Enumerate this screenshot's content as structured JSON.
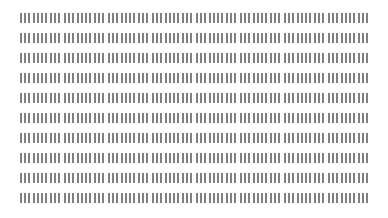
{
  "grid": {
    "rows": 10,
    "columns": 8,
    "bars_per_cell": 10,
    "bar_color": "#7f7f7f",
    "background_color": "#ffffff",
    "cell_content": "illegible-barcode-like-glyphs"
  }
}
